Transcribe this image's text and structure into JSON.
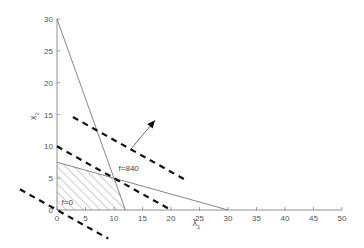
{
  "chart_data": {
    "type": "line",
    "title": "",
    "xlabel": "λ1",
    "ylabel": "x2",
    "xlim": [
      0,
      50
    ],
    "ylim": [
      0,
      30
    ],
    "xticks": [
      0,
      5,
      10,
      15,
      20,
      25,
      30,
      35,
      40,
      45,
      50
    ],
    "yticks": [
      0,
      5,
      10,
      15,
      20,
      25,
      30
    ],
    "grid": false,
    "legend": null,
    "constraints": [
      {
        "name": "constraint-1",
        "style": "solid",
        "points": [
          [
            0,
            30
          ],
          [
            12,
            0
          ]
        ]
      },
      {
        "name": "constraint-2",
        "style": "solid",
        "points": [
          [
            0,
            7.5
          ],
          [
            30,
            0
          ]
        ]
      }
    ],
    "feasible_region": {
      "fill": "hatched",
      "vertices": [
        [
          0,
          0
        ],
        [
          0,
          7.5
        ],
        [
          10,
          5
        ],
        [
          12,
          0
        ]
      ]
    },
    "objective_lines": [
      {
        "name": "f=0",
        "style": "dashed",
        "points": [
          [
            -6.5,
            3.25
          ],
          [
            9,
            -4.5
          ]
        ]
      },
      {
        "name": "f=840",
        "style": "dashed",
        "points": [
          [
            0,
            10
          ],
          [
            20,
            0
          ]
        ]
      },
      {
        "name": "upper",
        "style": "dashed",
        "points": [
          [
            2.8,
            14.6
          ],
          [
            23,
            4.5
          ]
        ]
      }
    ],
    "arrow": {
      "from": [
        12.8,
        9.4
      ],
      "to": [
        17.2,
        14.1
      ]
    },
    "annotations": [
      {
        "text": "f=840",
        "x": 10.8,
        "y": 6.2
      },
      {
        "text": "f=0",
        "x": 0.8,
        "y": 0.8
      }
    ],
    "optimum": [
      10,
      5
    ]
  }
}
